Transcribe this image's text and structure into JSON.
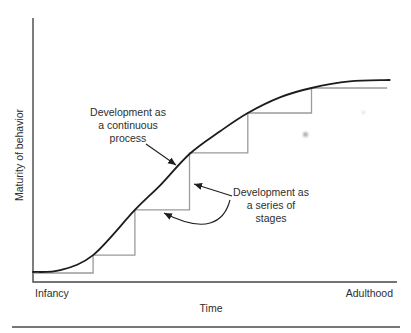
{
  "figure": {
    "background": "#ffffff",
    "footer_rule": {
      "from": [
        12,
        327
      ],
      "to": [
        400,
        327
      ],
      "color": "#4a4a4a",
      "width": 1.6
    },
    "artifacts": [
      {
        "x": 303,
        "y": 132,
        "size": 5,
        "opacity": 0.55
      },
      {
        "x": 362,
        "y": 111,
        "size": 3,
        "opacity": 0.28
      }
    ]
  },
  "chart_data": {
    "type": "line",
    "title": "",
    "xlabel": "Time",
    "ylabel": "Maturity of behavior",
    "x_domain": [
      0,
      100
    ],
    "y_domain": [
      0,
      100
    ],
    "x_tick_labels": [
      "Infancy",
      "Adulthood"
    ],
    "y_tick_labels": [],
    "grid": "off",
    "legend_position": "none (series identified by in-plot annotations with arrows)",
    "axis_color": "#474747",
    "axis_width": 1.4,
    "arrow_color": "#1f1f1f",
    "plot": {
      "left": 33,
      "right": 397,
      "top": 18,
      "bottom": 282
    },
    "series": [
      {
        "name": "Development as a continuous process",
        "style": "smooth",
        "color": "#1c1c1c",
        "width": 1.8,
        "points": [
          [
            0,
            3.8
          ],
          [
            7.5,
            4.5
          ],
          [
            16.5,
            10.2
          ],
          [
            28,
            27.3
          ],
          [
            35,
            36.7
          ],
          [
            43,
            48.5
          ],
          [
            51.5,
            57.2
          ],
          [
            59,
            64
          ],
          [
            68,
            70
          ],
          [
            76.5,
            73.5
          ],
          [
            87,
            76
          ],
          [
            98,
            76.5
          ]
        ]
      },
      {
        "name": "Development as a series of stages",
        "style": "steps",
        "color": "#9b9b9b",
        "width": 1.3,
        "points": [
          [
            0,
            3.4
          ],
          [
            16.5,
            3.4
          ],
          [
            16.5,
            10.2
          ],
          [
            28,
            10.2
          ],
          [
            28,
            27.3
          ],
          [
            43,
            27.3
          ],
          [
            43,
            48.9
          ],
          [
            59,
            48.9
          ],
          [
            59,
            64
          ],
          [
            76.5,
            64
          ],
          [
            76.5,
            73.5
          ],
          [
            97.3,
            73.5
          ]
        ]
      }
    ],
    "annotations": {
      "continuous": {
        "lines": [
          "Development as",
          "a continuous",
          "process"
        ],
        "pos": {
          "x": 128,
          "y": 106
        }
      },
      "stages": {
        "lines": [
          "Development as",
          "a series of",
          "stages"
        ],
        "pos": {
          "x": 271,
          "y": 186
        }
      }
    },
    "arrows": [
      {
        "name": "continuous-pointer-arrow",
        "kind": "line",
        "from": [
          146,
          144
        ],
        "to": [
          176,
          165
        ]
      },
      {
        "name": "stages-pointer-arrow-straight",
        "kind": "line",
        "from": [
          232,
          196
        ],
        "to": [
          194,
          184
        ]
      },
      {
        "name": "stages-pointer-arrow-curved",
        "kind": "cubic",
        "from": [
          230,
          200
        ],
        "c1": [
          224,
          223
        ],
        "c2": [
          205,
          234
        ],
        "to": [
          164,
          213
        ]
      }
    ],
    "ticks": {
      "infancy": {
        "text": "Infancy",
        "pos": {
          "x": 35,
          "y": 287
        }
      },
      "adulthood": {
        "text": "Adulthood",
        "pos": {
          "x": 393,
          "y": 287
        }
      }
    },
    "xlabel_pos": {
      "x": 211,
      "y": 302
    },
    "ylabel_pos": {
      "x": 19,
      "y": 155
    }
  }
}
